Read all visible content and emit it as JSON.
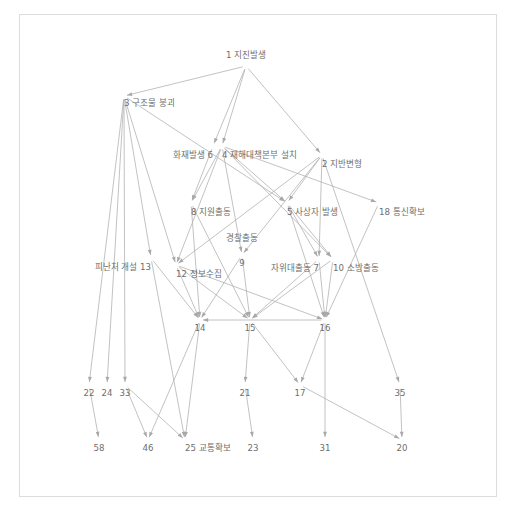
{
  "diagram": {
    "title_text_present": false,
    "colors": {
      "background": "#ffffff",
      "frame_border": "#dcdcdc",
      "edge": "#b3b3b3",
      "arrowhead": "#a8a8a8",
      "label_text": "#6e6e6e"
    },
    "frame": {
      "x": 19,
      "y": 14,
      "width": 478,
      "height": 483
    },
    "nodes": [
      {
        "id": "1",
        "label": "1 지진발생",
        "x": 246,
        "y": 66,
        "anchor": "middle",
        "label_dy": -8
      },
      {
        "id": "3",
        "label": "3 구조물 붕괴",
        "x": 124,
        "y": 96,
        "anchor": "start",
        "label_dy": 10
      },
      {
        "id": "6",
        "label": "화재발생 6",
        "x": 213,
        "y": 146,
        "anchor": "end",
        "label_dy": 12
      },
      {
        "id": "4",
        "label": "4 재해대책본부 설치",
        "x": 222,
        "y": 146,
        "anchor": "start",
        "label_dy": 12
      },
      {
        "id": "2",
        "label": "2 지반변형",
        "x": 322,
        "y": 155,
        "anchor": "start",
        "label_dy": 12
      },
      {
        "id": "8",
        "label": "8 지원출동",
        "x": 191,
        "y": 203,
        "anchor": "start",
        "label_dy": 12
      },
      {
        "id": "5",
        "label": "5 사상자 발생",
        "x": 287,
        "y": 203,
        "anchor": "start",
        "label_dy": 12
      },
      {
        "id": "18",
        "label": "18 통신확보",
        "x": 379,
        "y": 203,
        "anchor": "start",
        "label_dy": 12
      },
      {
        "id": "9",
        "label": "경찰출동",
        "x": 242,
        "y": 255,
        "anchor": "middle",
        "label_dy": -14
      },
      {
        "id": "9n",
        "label": "9",
        "x": 242,
        "y": 255,
        "anchor": "middle",
        "label_dy": 11
      },
      {
        "id": "13",
        "label": "피난처 개설 13",
        "x": 151,
        "y": 258,
        "anchor": "end",
        "label_dy": 12
      },
      {
        "id": "12",
        "label": "12 정보수집",
        "x": 176,
        "y": 265,
        "anchor": "start",
        "label_dy": 12
      },
      {
        "id": "7",
        "label": "자위대출동 7",
        "x": 319,
        "y": 259,
        "anchor": "end",
        "label_dy": 12
      },
      {
        "id": "10",
        "label": "10 소방출동",
        "x": 333,
        "y": 259,
        "anchor": "start",
        "label_dy": 12
      },
      {
        "id": "14",
        "label": "14",
        "x": 200,
        "y": 320,
        "anchor": "middle",
        "label_dy": 11
      },
      {
        "id": "15",
        "label": "15",
        "x": 250,
        "y": 320,
        "anchor": "middle",
        "label_dy": 11
      },
      {
        "id": "16",
        "label": "16",
        "x": 325,
        "y": 320,
        "anchor": "middle",
        "label_dy": 11
      },
      {
        "id": "22",
        "label": "22",
        "x": 89,
        "y": 385,
        "anchor": "middle",
        "label_dy": 11
      },
      {
        "id": "24",
        "label": "24",
        "x": 107,
        "y": 385,
        "anchor": "middle",
        "label_dy": 11
      },
      {
        "id": "33",
        "label": "33",
        "x": 125,
        "y": 385,
        "anchor": "middle",
        "label_dy": 11
      },
      {
        "id": "21",
        "label": "21",
        "x": 245,
        "y": 385,
        "anchor": "middle",
        "label_dy": 11
      },
      {
        "id": "17",
        "label": "17",
        "x": 300,
        "y": 385,
        "anchor": "middle",
        "label_dy": 11
      },
      {
        "id": "35",
        "label": "35",
        "x": 400,
        "y": 385,
        "anchor": "middle",
        "label_dy": 11
      },
      {
        "id": "58",
        "label": "58",
        "x": 99,
        "y": 440,
        "anchor": "middle",
        "label_dy": 11
      },
      {
        "id": "46",
        "label": "46",
        "x": 148,
        "y": 440,
        "anchor": "middle",
        "label_dy": 11
      },
      {
        "id": "25",
        "label": "25 교통확보",
        "x": 185,
        "y": 440,
        "anchor": "start",
        "label_dy": 11
      },
      {
        "id": "23",
        "label": "23",
        "x": 253,
        "y": 440,
        "anchor": "middle",
        "label_dy": 11
      },
      {
        "id": "31",
        "label": "31",
        "x": 325,
        "y": 440,
        "anchor": "middle",
        "label_dy": 11
      },
      {
        "id": "20",
        "label": "20",
        "x": 402,
        "y": 440,
        "anchor": "middle",
        "label_dy": 11
      }
    ],
    "edges": [
      {
        "from": "1",
        "to": "3"
      },
      {
        "from": "1",
        "to": "4"
      },
      {
        "from": "1",
        "to": "6"
      },
      {
        "from": "1",
        "to": "2"
      },
      {
        "from": "3",
        "to": "12"
      },
      {
        "from": "3",
        "to": "13"
      },
      {
        "from": "3",
        "to": "22"
      },
      {
        "from": "3",
        "to": "24"
      },
      {
        "from": "3",
        "to": "33"
      },
      {
        "from": "3",
        "to": "5"
      },
      {
        "from": "6",
        "to": "8"
      },
      {
        "from": "4",
        "to": "8"
      },
      {
        "from": "4",
        "to": "9"
      },
      {
        "from": "4",
        "to": "12"
      },
      {
        "from": "4",
        "to": "5"
      },
      {
        "from": "4",
        "to": "10"
      },
      {
        "from": "4",
        "to": "18"
      },
      {
        "from": "2",
        "to": "12"
      },
      {
        "from": "2",
        "to": "9"
      },
      {
        "from": "2",
        "to": "7"
      },
      {
        "from": "2",
        "to": "35"
      },
      {
        "from": "2",
        "to": "5"
      },
      {
        "from": "5",
        "to": "7"
      },
      {
        "from": "5",
        "to": "10"
      },
      {
        "from": "5",
        "to": "16"
      },
      {
        "from": "8",
        "to": "14"
      },
      {
        "from": "8",
        "to": "15"
      },
      {
        "from": "18",
        "to": "16"
      },
      {
        "from": "9",
        "to": "14"
      },
      {
        "from": "9",
        "to": "15"
      },
      {
        "from": "12",
        "to": "14"
      },
      {
        "from": "12",
        "to": "15"
      },
      {
        "from": "12",
        "to": "16"
      },
      {
        "from": "13",
        "to": "14"
      },
      {
        "from": "7",
        "to": "15"
      },
      {
        "from": "7",
        "to": "16"
      },
      {
        "from": "10",
        "to": "16"
      },
      {
        "from": "10",
        "to": "15"
      },
      {
        "from": "14",
        "to": "46"
      },
      {
        "from": "14",
        "to": "25"
      },
      {
        "from": "15",
        "to": "21"
      },
      {
        "from": "15",
        "to": "17"
      },
      {
        "from": "16",
        "to": "17"
      },
      {
        "from": "16",
        "to": "31"
      },
      {
        "from": "33",
        "to": "46"
      },
      {
        "from": "33",
        "to": "25"
      },
      {
        "from": "22",
        "to": "58"
      },
      {
        "from": "21",
        "to": "23"
      },
      {
        "from": "17",
        "to": "20"
      },
      {
        "from": "35",
        "to": "20"
      },
      {
        "from": "13",
        "to": "25"
      },
      {
        "from": "16",
        "to": "14"
      }
    ]
  }
}
